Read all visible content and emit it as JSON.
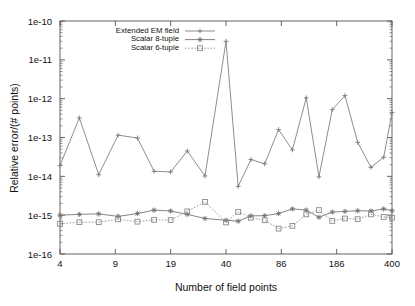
{
  "chart_data": {
    "type": "line",
    "title": "",
    "xlabel": "Number of field points",
    "ylabel": "Relative error/(# points)",
    "xscale": "log-index",
    "yscale": "log",
    "ylim": [
      1e-16,
      1e-10
    ],
    "xtick_labels": [
      "4",
      "9",
      "19",
      "40",
      "86",
      "186",
      "400"
    ],
    "ytick_labels": [
      "1e-16",
      "1e-15",
      "1e-14",
      "1e-13",
      "1e-12",
      "1e-11",
      "1e-10"
    ],
    "ytick_values": [
      1e-16,
      1e-15,
      1e-14,
      1e-13,
      1e-12,
      1e-11,
      1e-10
    ],
    "grid": false,
    "legend_position": "top-left-inside",
    "minor_ticks": true,
    "series": [
      {
        "name": "Extended EM field",
        "marker": "plus",
        "line": "solid",
        "color": "#7a7a7a",
        "x": [
          0.0,
          0.35,
          0.7,
          1.05,
          1.4,
          1.7,
          2.0,
          2.3,
          2.62,
          3.0,
          3.22,
          3.45,
          3.7,
          3.95,
          4.2,
          4.45,
          4.68,
          4.92,
          5.15,
          5.38,
          5.62,
          5.85,
          6.0
        ],
        "values": [
          1.9e-14,
          3.2e-13,
          1.1e-14,
          1.15e-13,
          9.7e-14,
          1.35e-14,
          1.3e-14,
          4.5e-14,
          1.02e-14,
          3e-11,
          5.5e-15,
          2.7e-14,
          2.1e-14,
          1.6e-13,
          4.8e-14,
          1.05e-12,
          9.7e-15,
          5.2e-13,
          1.2e-12,
          7.5e-14,
          1.7e-14,
          3.1e-14,
          4.4e-13
        ]
      },
      {
        "name": "Scalar 8-tuple",
        "marker": "star",
        "line": "solid",
        "color": "#6e6e6e",
        "x": [
          0.0,
          0.35,
          0.7,
          1.05,
          1.4,
          1.7,
          2.0,
          2.3,
          2.62,
          3.0,
          3.22,
          3.45,
          3.7,
          3.95,
          4.2,
          4.45,
          4.68,
          4.92,
          5.15,
          5.38,
          5.62,
          5.85,
          6.0
        ],
        "values": [
          1e-15,
          1.05e-15,
          1.08e-15,
          9.3e-16,
          1.1e-15,
          1.35e-15,
          1.28e-15,
          1.05e-15,
          8.2e-16,
          7.4e-16,
          7e-16,
          9.6e-16,
          9.7e-16,
          1.1e-15,
          1.45e-15,
          1.35e-15,
          8.8e-16,
          1.2e-15,
          1.25e-15,
          1.3e-15,
          1.28e-15,
          1.45e-15,
          1.3e-15
        ]
      },
      {
        "name": "Scalar 6-tuple",
        "marker": "square",
        "line": "dotted",
        "color": "#8a8a8a",
        "x": [
          0.0,
          0.35,
          0.7,
          1.05,
          1.4,
          1.7,
          2.0,
          2.3,
          2.62,
          3.0,
          3.22,
          3.45,
          3.7,
          3.95,
          4.2,
          4.45,
          4.68,
          4.92,
          5.15,
          5.38,
          5.62,
          5.85,
          6.0
        ],
        "values": [
          6e-16,
          6.6e-16,
          6.6e-16,
          7.8e-16,
          6.8e-16,
          7.6e-16,
          7.5e-16,
          1.25e-15,
          2.2e-15,
          6.5e-16,
          1.22e-15,
          8.6e-16,
          7.4e-16,
          4.5e-16,
          5.3e-16,
          1.05e-15,
          1.35e-15,
          7.1e-16,
          8.2e-16,
          7.9e-16,
          1.05e-15,
          9e-16,
          8.6e-16
        ]
      }
    ]
  },
  "axes": {
    "xlabel": "Number of field points",
    "ylabel": "Relative error/(# points)"
  },
  "legend": {
    "items": [
      {
        "label": "Extended EM field"
      },
      {
        "label": "Scalar 8-tuple"
      },
      {
        "label": "Scalar 6-tuple"
      }
    ]
  }
}
